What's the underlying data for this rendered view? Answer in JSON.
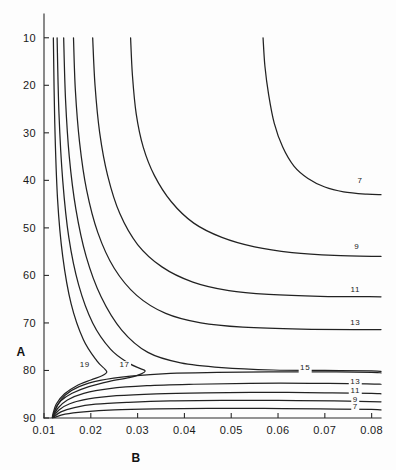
{
  "figure": {
    "background_color": "#fdfdfd",
    "line_color": "#222222",
    "text_color": "#1a1a1a"
  },
  "axes": {
    "x_title": "B",
    "y_title": "A",
    "x_ticks": [
      "0.01",
      "0.02",
      "0.03",
      "0.04",
      "0.05",
      "0.06",
      "0.07",
      "0.08"
    ],
    "y_ticks": [
      "90",
      "80",
      "70",
      "60",
      "50",
      "40",
      "30",
      "20",
      "10"
    ]
  },
  "chart_data": {
    "type": "line",
    "title": "",
    "xlabel": "B",
    "ylabel": "A",
    "xlim": [
      0.01,
      0.082
    ],
    "ylim": [
      10,
      95
    ],
    "grid": false,
    "legend": "none",
    "plot_kind": "contour",
    "contour_levels": [
      7,
      9,
      11,
      13,
      15,
      17,
      19
    ],
    "xticks": [
      0.01,
      0.02,
      0.03,
      0.04,
      0.05,
      0.06,
      0.07,
      0.08
    ],
    "yticks": [
      10,
      20,
      30,
      40,
      50,
      60,
      70,
      80,
      90
    ],
    "annotations": [
      {
        "text": "7",
        "x": 0.0775,
        "y": 59.5
      },
      {
        "text": "9",
        "x": 0.0768,
        "y": 45.5
      },
      {
        "text": "11",
        "x": 0.0765,
        "y": 36.5
      },
      {
        "text": "13",
        "x": 0.0765,
        "y": 29.5
      },
      {
        "text": "15",
        "x": 0.0658,
        "y": 20.0
      },
      {
        "text": "13",
        "x": 0.0765,
        "y": 17.2
      },
      {
        "text": "11",
        "x": 0.0765,
        "y": 15.2
      },
      {
        "text": "9",
        "x": 0.0765,
        "y": 13.4
      },
      {
        "text": "7",
        "x": 0.0765,
        "y": 11.9
      },
      {
        "text": "19",
        "x": 0.0187,
        "y": 20.7
      },
      {
        "text": "17",
        "x": 0.0272,
        "y": 20.7
      }
    ],
    "series": [
      {
        "name": "7 (upper branch)",
        "level": 7,
        "points": [
          [
            0.0568,
            90.0
          ],
          [
            0.0572,
            84.0
          ],
          [
            0.058,
            78.0
          ],
          [
            0.0592,
            72.0
          ],
          [
            0.061,
            67.0
          ],
          [
            0.0634,
            63.0
          ],
          [
            0.0664,
            60.4
          ],
          [
            0.07,
            58.6
          ],
          [
            0.074,
            57.6
          ],
          [
            0.079,
            57.1
          ],
          [
            0.082,
            57.0
          ]
        ]
      },
      {
        "name": "9 (upper branch)",
        "level": 9,
        "points": [
          [
            0.0285,
            90.0
          ],
          [
            0.0289,
            82.0
          ],
          [
            0.0297,
            74.0
          ],
          [
            0.0312,
            67.0
          ],
          [
            0.0336,
            61.0
          ],
          [
            0.0372,
            55.5
          ],
          [
            0.042,
            51.0
          ],
          [
            0.048,
            48.0
          ],
          [
            0.055,
            46.0
          ],
          [
            0.063,
            44.8
          ],
          [
            0.072,
            44.2
          ],
          [
            0.082,
            44.0
          ]
        ]
      },
      {
        "name": "11 (upper branch)",
        "level": 11,
        "points": [
          [
            0.0204,
            90.0
          ],
          [
            0.0209,
            80.0
          ],
          [
            0.0219,
            70.0
          ],
          [
            0.0236,
            61.0
          ],
          [
            0.0262,
            53.0
          ],
          [
            0.03,
            46.5
          ],
          [
            0.0352,
            41.8
          ],
          [
            0.0418,
            38.6
          ],
          [
            0.0495,
            36.8
          ],
          [
            0.058,
            36.0
          ],
          [
            0.069,
            35.6
          ],
          [
            0.082,
            35.5
          ]
        ]
      },
      {
        "name": "13 (upper branch)",
        "level": 13,
        "points": [
          [
            0.0163,
            90.0
          ],
          [
            0.0167,
            79.0
          ],
          [
            0.0176,
            68.0
          ],
          [
            0.0191,
            58.0
          ],
          [
            0.0215,
            49.0
          ],
          [
            0.025,
            41.5
          ],
          [
            0.0298,
            35.8
          ],
          [
            0.036,
            32.0
          ],
          [
            0.0435,
            30.0
          ],
          [
            0.0525,
            29.1
          ],
          [
            0.065,
            28.7
          ],
          [
            0.082,
            28.6
          ]
        ]
      },
      {
        "name": "15 (upper branch)",
        "level": 15,
        "points": [
          [
            0.0142,
            90.0
          ],
          [
            0.0146,
            77.0
          ],
          [
            0.0154,
            65.0
          ],
          [
            0.0168,
            54.0
          ],
          [
            0.019,
            44.0
          ],
          [
            0.0222,
            35.5
          ],
          [
            0.0266,
            28.5
          ],
          [
            0.0322,
            23.8
          ],
          [
            0.0392,
            21.6
          ],
          [
            0.048,
            20.6
          ],
          [
            0.059,
            20.1
          ],
          [
            0.07,
            20.0
          ],
          [
            0.08,
            19.9
          ],
          [
            0.082,
            19.8
          ]
        ]
      },
      {
        "name": "17 (nose)",
        "level": 17,
        "points": [
          [
            0.0128,
            90.0
          ],
          [
            0.0132,
            74.0
          ],
          [
            0.014,
            60.0
          ],
          [
            0.0153,
            48.0
          ],
          [
            0.0174,
            38.0
          ],
          [
            0.0204,
            30.0
          ],
          [
            0.0242,
            24.5
          ],
          [
            0.028,
            21.6
          ],
          [
            0.0306,
            20.4
          ],
          [
            0.0316,
            19.9
          ],
          [
            0.0308,
            19.3
          ],
          [
            0.0282,
            18.5
          ],
          [
            0.024,
            17.7
          ],
          [
            0.0196,
            16.6
          ],
          [
            0.016,
            15.2
          ],
          [
            0.0136,
            13.6
          ],
          [
            0.0123,
            11.6
          ],
          [
            0.012,
            10.2
          ]
        ]
      },
      {
        "name": "19 (nose)",
        "level": 19,
        "points": [
          [
            0.012,
            90.0
          ],
          [
            0.0123,
            72.0
          ],
          [
            0.0129,
            56.0
          ],
          [
            0.014,
            44.0
          ],
          [
            0.0158,
            34.0
          ],
          [
            0.0184,
            26.5
          ],
          [
            0.0213,
            22.0
          ],
          [
            0.023,
            20.3
          ],
          [
            0.0234,
            19.6
          ],
          [
            0.0224,
            18.9
          ],
          [
            0.02,
            18.0
          ],
          [
            0.017,
            16.8
          ],
          [
            0.0144,
            15.1
          ],
          [
            0.0126,
            12.9
          ],
          [
            0.0119,
            10.8
          ],
          [
            0.0118,
            10.1
          ]
        ]
      },
      {
        "name": "15 (lower branch)",
        "level": 15,
        "points": [
          [
            0.0118,
            10.1
          ],
          [
            0.0128,
            12.6
          ],
          [
            0.0145,
            14.8
          ],
          [
            0.0175,
            16.6
          ],
          [
            0.022,
            17.9
          ],
          [
            0.0285,
            18.8
          ],
          [
            0.037,
            19.4
          ],
          [
            0.047,
            19.6
          ],
          [
            0.058,
            19.7
          ],
          [
            0.07,
            19.7
          ],
          [
            0.08,
            19.6
          ],
          [
            0.082,
            19.5
          ]
        ]
      },
      {
        "name": "13 (lower branch)",
        "level": 13,
        "points": [
          [
            0.0118,
            10.1
          ],
          [
            0.013,
            12.1
          ],
          [
            0.015,
            13.8
          ],
          [
            0.0185,
            15.2
          ],
          [
            0.024,
            16.2
          ],
          [
            0.032,
            16.8
          ],
          [
            0.042,
            17.1
          ],
          [
            0.054,
            17.3
          ],
          [
            0.067,
            17.3
          ],
          [
            0.079,
            17.2
          ],
          [
            0.082,
            17.1
          ]
        ]
      },
      {
        "name": "11 (lower branch)",
        "level": 11,
        "points": [
          [
            0.0119,
            10.1
          ],
          [
            0.0132,
            11.7
          ],
          [
            0.0155,
            13.0
          ],
          [
            0.0195,
            14.0
          ],
          [
            0.0255,
            14.7
          ],
          [
            0.034,
            15.1
          ],
          [
            0.0445,
            15.3
          ],
          [
            0.057,
            15.4
          ],
          [
            0.07,
            15.3
          ],
          [
            0.08,
            15.2
          ],
          [
            0.082,
            15.1
          ]
        ]
      },
      {
        "name": "9 (lower branch)",
        "level": 9,
        "points": [
          [
            0.012,
            10.1
          ],
          [
            0.0136,
            11.3
          ],
          [
            0.0165,
            12.2
          ],
          [
            0.021,
            12.9
          ],
          [
            0.028,
            13.3
          ],
          [
            0.037,
            13.6
          ],
          [
            0.048,
            13.7
          ],
          [
            0.06,
            13.7
          ],
          [
            0.072,
            13.6
          ],
          [
            0.082,
            13.4
          ]
        ]
      },
      {
        "name": "7 (lower branch)",
        "level": 7,
        "points": [
          [
            0.0122,
            10.1
          ],
          [
            0.0145,
            10.8
          ],
          [
            0.0185,
            11.3
          ],
          [
            0.025,
            11.7
          ],
          [
            0.034,
            11.9
          ],
          [
            0.045,
            12.0
          ],
          [
            0.057,
            12.0
          ],
          [
            0.069,
            11.9
          ],
          [
            0.08,
            11.8
          ],
          [
            0.082,
            11.7
          ]
        ]
      }
    ]
  }
}
